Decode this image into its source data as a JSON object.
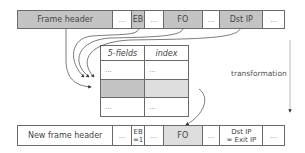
{
  "top_row": {
    "cells": [
      {
        "label": "Frame header",
        "width": 96,
        "shade": "gray"
      },
      {
        "label": "...",
        "width": 19,
        "shade": "white"
      },
      {
        "label": "EB",
        "width": 13,
        "shade": "gray"
      },
      {
        "label": "...",
        "width": 19,
        "shade": "white"
      },
      {
        "label": "FO",
        "width": 39,
        "shade": "gray"
      },
      {
        "label": "...",
        "width": 18,
        "shade": "white"
      },
      {
        "label": "Dst IP",
        "width": 43,
        "shade": "gray"
      },
      {
        "label": "...",
        "width": 21,
        "shade": "white"
      }
    ]
  },
  "table": {
    "headers": [
      "5-fields",
      "index"
    ],
    "rows": [
      [
        "...",
        "..."
      ],
      [
        "",
        ""
      ],
      [
        "...",
        "..."
      ]
    ],
    "highlighted_row": 1
  },
  "bottom_row": {
    "cells": [
      {
        "label": "New frame header",
        "width": 96,
        "shade": "white"
      },
      {
        "label": "...",
        "width": 19,
        "shade": "white"
      },
      {
        "label": "EB\n=1",
        "width": 13,
        "shade": "white"
      },
      {
        "label": "...",
        "width": 19,
        "shade": "white"
      },
      {
        "label": "FO",
        "width": 39,
        "shade": "lgray"
      },
      {
        "label": "...",
        "width": 18,
        "shade": "white"
      },
      {
        "label": "Dst IP\n= Exit IP",
        "width": 43,
        "shade": "white"
      },
      {
        "label": "...",
        "width": 21,
        "shade": "white"
      }
    ]
  },
  "annotation": {
    "transformation": "transformation"
  }
}
